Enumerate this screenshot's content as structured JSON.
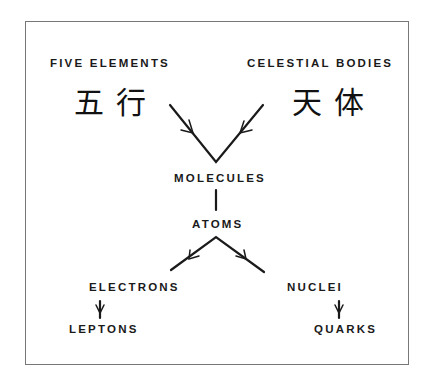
{
  "diagram": {
    "type": "flow-hierarchy",
    "nodes": {
      "five_elements": {
        "label": "FIVE ELEMENTS",
        "chinese": "五行"
      },
      "celestial_bodies": {
        "label": "CELESTIAL BODIES",
        "chinese": "天体"
      },
      "molecules": {
        "label": "MOLECULES"
      },
      "atoms": {
        "label": "ATOMS"
      },
      "electrons": {
        "label": "ELECTRONS"
      },
      "nuclei": {
        "label": "NUCLEI"
      },
      "leptons": {
        "label": "LEPTONS"
      },
      "quarks": {
        "label": "QUARKS"
      }
    },
    "edges": [
      {
        "from": "FIVE ELEMENTS",
        "to": "MOLECULES",
        "arrow": true
      },
      {
        "from": "CELESTIAL BODIES",
        "to": "MOLECULES",
        "arrow": true
      },
      {
        "from": "MOLECULES",
        "to": "ATOMS",
        "arrow": false
      },
      {
        "from": "ATOMS",
        "to": "ELECTRONS",
        "arrow": true
      },
      {
        "from": "ATOMS",
        "to": "NUCLEI",
        "arrow": true
      },
      {
        "from": "ELECTRONS",
        "to": "LEPTONS",
        "arrow": true
      },
      {
        "from": "NUCLEI",
        "to": "QUARKS",
        "arrow": true
      }
    ],
    "colors": {
      "ink": "#1a1a1a",
      "border": "#777777",
      "background": "#ffffff"
    }
  }
}
